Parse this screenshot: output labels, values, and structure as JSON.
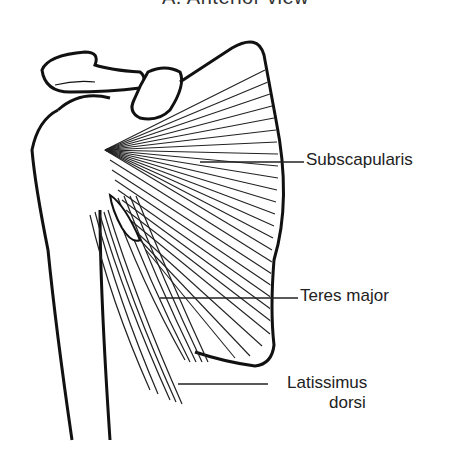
{
  "figure": {
    "title": "A. Anterior view",
    "title_visible": "partially clipped at top edge"
  },
  "labels": [
    {
      "id": "subscapularis",
      "text": "Subscapularis"
    },
    {
      "id": "teres-major",
      "text": "Teres major"
    },
    {
      "id": "latissimus-dorsi",
      "line1": "Latissimus",
      "line2": "dorsi"
    }
  ],
  "colors": {
    "ink": "#1a1a1a",
    "background": "#ffffff"
  }
}
